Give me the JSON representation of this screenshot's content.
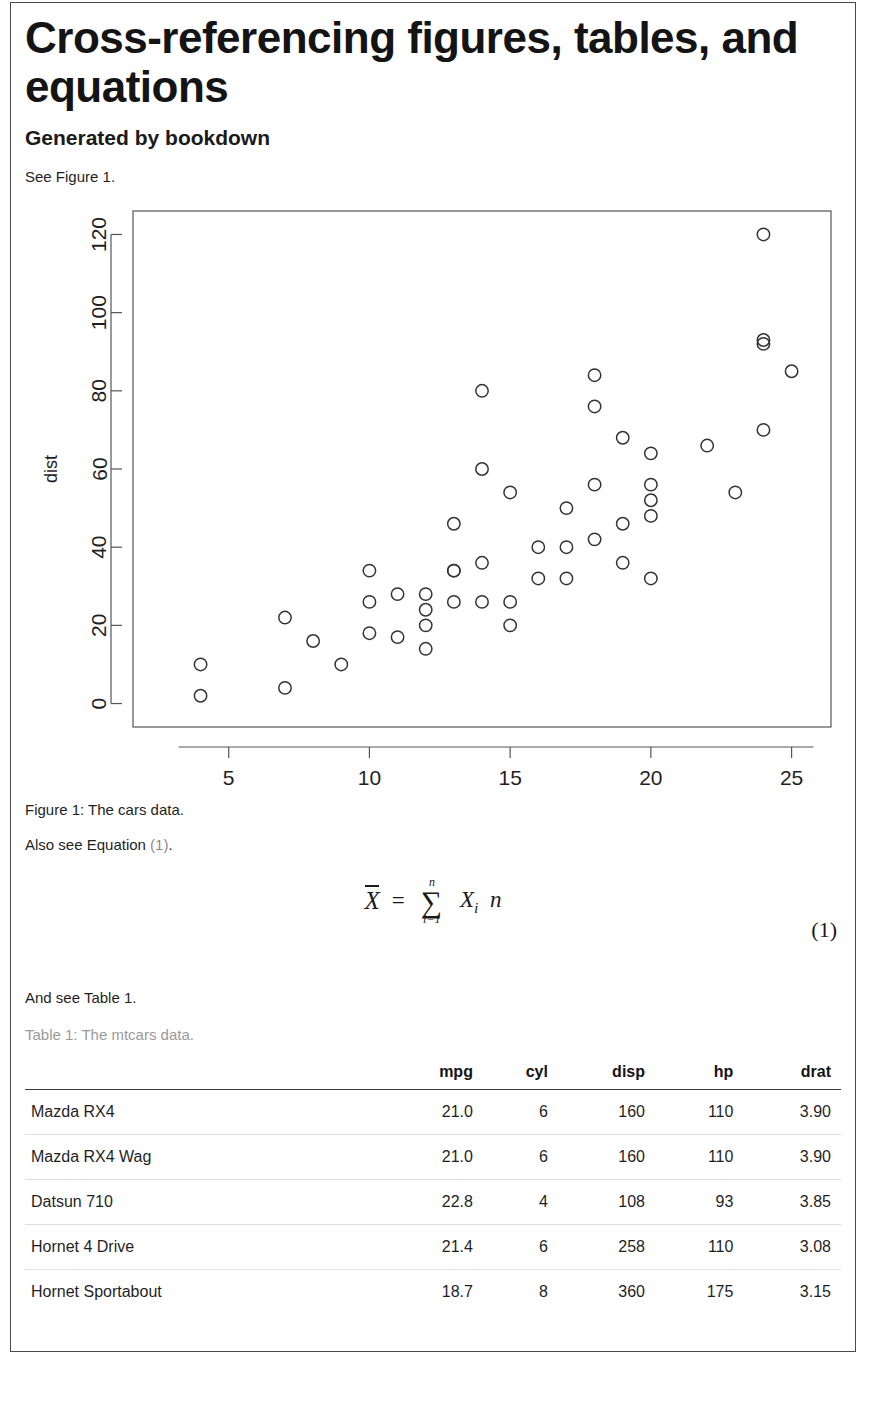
{
  "document": {
    "title": "Cross-referencing figures, tables, and equations",
    "subtitle": "Generated by bookdown",
    "para_figure_ref": "See Figure 1.",
    "para_equation_ref_prefix": "Also see Equation ",
    "para_equation_ref_link": "(1)",
    "para_equation_ref_suffix": ".",
    "para_table_ref": "And see Table 1.",
    "figure_caption": "Figure 1: The cars data.",
    "table_caption": "Table 1: The mtcars data."
  },
  "equation": {
    "number": "(1)",
    "lhs": "X",
    "equals": "=",
    "sum_symbol": "∑",
    "sum_upper": "n",
    "sum_lower": "i=1",
    "numerator_term": "X",
    "numerator_sub": "i",
    "denominator": "n"
  },
  "chart_data": {
    "type": "scatter",
    "title": "",
    "xlabel": "speed",
    "ylabel": "dist",
    "xlim": [
      1.6,
      26.4
    ],
    "ylim": [
      -6,
      126
    ],
    "xticks": [
      5,
      10,
      15,
      20,
      25
    ],
    "yticks": [
      0,
      20,
      40,
      60,
      80,
      100,
      120
    ],
    "grid": false,
    "legend": null,
    "marker": "open-circle",
    "x": [
      4,
      4,
      7,
      7,
      8,
      9,
      10,
      10,
      10,
      11,
      11,
      12,
      12,
      12,
      12,
      13,
      13,
      13,
      13,
      14,
      14,
      14,
      14,
      15,
      15,
      15,
      16,
      16,
      17,
      17,
      17,
      18,
      18,
      18,
      18,
      19,
      19,
      19,
      20,
      20,
      20,
      20,
      20,
      22,
      23,
      24,
      24,
      24,
      24,
      25
    ],
    "y": [
      2,
      10,
      4,
      22,
      16,
      10,
      18,
      26,
      34,
      17,
      28,
      14,
      20,
      24,
      28,
      26,
      34,
      34,
      46,
      26,
      36,
      60,
      80,
      20,
      26,
      54,
      32,
      40,
      32,
      40,
      50,
      42,
      56,
      76,
      84,
      36,
      46,
      68,
      32,
      48,
      52,
      56,
      64,
      66,
      54,
      70,
      92,
      93,
      120,
      85
    ]
  },
  "table": {
    "row_header_label": "",
    "columns": [
      "mpg",
      "cyl",
      "disp",
      "hp",
      "drat"
    ],
    "rows": [
      {
        "name": "Mazda RX4",
        "values": [
          "21.0",
          "6",
          "160",
          "110",
          "3.90"
        ]
      },
      {
        "name": "Mazda RX4 Wag",
        "values": [
          "21.0",
          "6",
          "160",
          "110",
          "3.90"
        ]
      },
      {
        "name": "Datsun 710",
        "values": [
          "22.8",
          "4",
          "108",
          "93",
          "3.85"
        ]
      },
      {
        "name": "Hornet 4 Drive",
        "values": [
          "21.4",
          "6",
          "258",
          "110",
          "3.08"
        ]
      },
      {
        "name": "Hornet Sportabout",
        "values": [
          "18.7",
          "8",
          "360",
          "175",
          "3.15"
        ]
      }
    ]
  },
  "colors": {
    "frame": "#4a4a4a",
    "text": "#1f1f1f",
    "muted": "#9a9a9a",
    "plot_axis": "#555555",
    "marker_stroke": "#333333"
  }
}
